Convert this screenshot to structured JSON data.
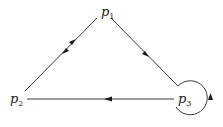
{
  "diagram": {
    "type": "directed-graph",
    "nodes": [
      {
        "id": "p1",
        "label": "p",
        "sub": "1"
      },
      {
        "id": "p2",
        "label": "p",
        "sub": "2"
      },
      {
        "id": "p3",
        "label": "p",
        "sub": "3"
      }
    ],
    "edges": [
      {
        "from": "p1",
        "to": "p2"
      },
      {
        "from": "p2",
        "to": "p1"
      },
      {
        "from": "p1",
        "to": "p3"
      },
      {
        "from": "p3",
        "to": "p2"
      },
      {
        "from": "p3",
        "to": "p3",
        "kind": "self-loop"
      }
    ],
    "colors": {
      "line": "#3a3a3a",
      "text": "#1a1a1a",
      "background": "#ffffff"
    }
  }
}
